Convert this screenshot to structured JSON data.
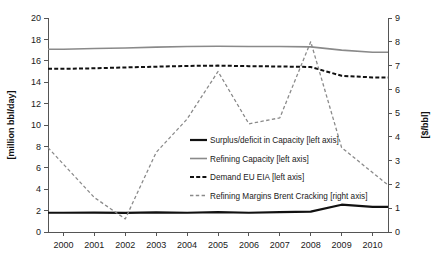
{
  "chart_data": {
    "type": "line",
    "title": "",
    "xlabel": "",
    "ylabel": "[million bbl/day]",
    "y2label": "[$/bbl]",
    "x": [
      2000,
      2001,
      2002,
      2003,
      2004,
      2005,
      2006,
      2007,
      2008,
      2009,
      2010
    ],
    "categories": [
      "2000",
      "2001",
      "2002",
      "2003",
      "2004",
      "2005",
      "2006",
      "2007",
      "2008",
      "2009",
      "2010"
    ],
    "xlim": [
      1999.5,
      2010.5
    ],
    "ylim": [
      0,
      20
    ],
    "y2lim": [
      0,
      9
    ],
    "yticks": [
      0,
      2,
      4,
      6,
      8,
      10,
      12,
      14,
      16,
      18,
      20
    ],
    "y2ticks": [
      0,
      1,
      2,
      3,
      4,
      5,
      6,
      7,
      8,
      9
    ],
    "grid": false,
    "legend_position": "center",
    "series": [
      {
        "name": "Surplus/deficit in Capacity [left axis]",
        "axis": "left",
        "style": "solid",
        "color": "#111111",
        "width": 2.2,
        "values": [
          1.8,
          1.82,
          1.78,
          1.83,
          1.8,
          1.86,
          1.8,
          1.85,
          1.9,
          2.55,
          2.35
        ]
      },
      {
        "name": "Refining Capacity [left axis]",
        "axis": "left",
        "style": "solid",
        "color": "#8a8a8a",
        "width": 1.6,
        "values": [
          17.08,
          17.15,
          17.2,
          17.28,
          17.33,
          17.36,
          17.34,
          17.33,
          17.3,
          17.0,
          16.8
        ]
      },
      {
        "name": "Demand EU EIA [left axis]",
        "axis": "left",
        "style": "dashed",
        "color": "#111111",
        "width": 2.0,
        "values": [
          15.25,
          15.3,
          15.38,
          15.45,
          15.52,
          15.55,
          15.5,
          15.47,
          15.42,
          14.6,
          14.45
        ]
      },
      {
        "name": "Refining Margins Brent Cracking [right axis]",
        "axis": "right",
        "style": "dashed",
        "color": "#8a8a8a",
        "width": 1.3,
        "values": [
          2.85,
          1.45,
          0.55,
          3.35,
          4.75,
          6.75,
          4.55,
          4.8,
          8.0,
          3.55,
          2.5
        ]
      }
    ],
    "edge_points": {
      "left_edge_margin_value": 1.9,
      "note": "Refining margins series extends to plot edges"
    }
  },
  "axes": {
    "left": {
      "label": "[million bbl/day]",
      "ticks": [
        "0",
        "2",
        "4",
        "6",
        "8",
        "10",
        "12",
        "14",
        "16",
        "18",
        "20"
      ]
    },
    "right": {
      "label": "[$/bbl]",
      "ticks": [
        "0",
        "1",
        "2",
        "3",
        "4",
        "5",
        "6",
        "7",
        "8",
        "9"
      ]
    },
    "bottom": {
      "ticks": [
        "2000",
        "2001",
        "2002",
        "2003",
        "2004",
        "2005",
        "2006",
        "2007",
        "2008",
        "2009",
        "2010"
      ]
    }
  },
  "legend": {
    "entries": [
      {
        "label": "Surplus/deficit in Capacity [left axis]",
        "color": "#111111",
        "style": "solid",
        "width": 2.2
      },
      {
        "label": "Refining Capacity [left axis]",
        "color": "#8a8a8a",
        "style": "solid",
        "width": 1.6
      },
      {
        "label": "Demand EU EIA [left axis]",
        "color": "#111111",
        "style": "dashed",
        "width": 2.0
      },
      {
        "label": "Refining Margins Brent Cracking [right axis]",
        "color": "#8a8a8a",
        "style": "dashed",
        "width": 1.3
      }
    ]
  }
}
